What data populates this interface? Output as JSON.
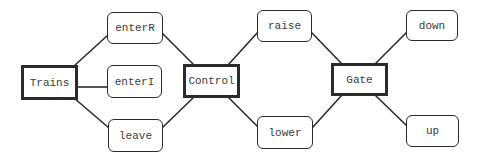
{
  "diagram": {
    "type": "process-action-graph",
    "nodes": [
      {
        "id": "trains",
        "label": "Trains",
        "kind": "process",
        "x": 21,
        "y": 65,
        "w": 57,
        "h": 35
      },
      {
        "id": "enterR",
        "label": "enterR",
        "kind": "action",
        "x": 107,
        "y": 12,
        "w": 56,
        "h": 32
      },
      {
        "id": "enterI",
        "label": "enterI",
        "kind": "action",
        "x": 107,
        "y": 65,
        "w": 55,
        "h": 33
      },
      {
        "id": "leave",
        "label": "leave",
        "kind": "action",
        "x": 108,
        "y": 119,
        "w": 55,
        "h": 33
      },
      {
        "id": "control",
        "label": "Control",
        "kind": "process",
        "x": 183,
        "y": 64,
        "w": 57,
        "h": 34
      },
      {
        "id": "raise",
        "label": "raise",
        "kind": "action",
        "x": 257,
        "y": 10,
        "w": 55,
        "h": 32
      },
      {
        "id": "lower",
        "label": "lower",
        "kind": "action",
        "x": 257,
        "y": 116,
        "w": 56,
        "h": 33
      },
      {
        "id": "gate",
        "label": "Gate",
        "kind": "process",
        "x": 331,
        "y": 63,
        "w": 57,
        "h": 33
      },
      {
        "id": "down",
        "label": "down",
        "kind": "action",
        "x": 406,
        "y": 10,
        "w": 52,
        "h": 31
      },
      {
        "id": "up",
        "label": "up",
        "kind": "action",
        "x": 406,
        "y": 115,
        "w": 53,
        "h": 32
      }
    ],
    "edges": [
      {
        "from": "trains",
        "to": "enterR",
        "x1": 74,
        "y1": 66,
        "x2": 108,
        "y2": 35
      },
      {
        "from": "trains",
        "to": "enterI",
        "x1": 77,
        "y1": 87,
        "x2": 107,
        "y2": 87
      },
      {
        "from": "trains",
        "to": "leave",
        "x1": 74,
        "y1": 98,
        "x2": 109,
        "y2": 128
      },
      {
        "from": "enterR",
        "to": "control",
        "x1": 162,
        "y1": 33,
        "x2": 194,
        "y2": 65
      },
      {
        "from": "leave",
        "to": "control",
        "x1": 162,
        "y1": 128,
        "x2": 194,
        "y2": 97
      },
      {
        "from": "control",
        "to": "raise",
        "x1": 228,
        "y1": 65,
        "x2": 258,
        "y2": 32
      },
      {
        "from": "control",
        "to": "lower",
        "x1": 228,
        "y1": 97,
        "x2": 258,
        "y2": 127
      },
      {
        "from": "raise",
        "to": "gate",
        "x1": 311,
        "y1": 32,
        "x2": 342,
        "y2": 64
      },
      {
        "from": "lower",
        "to": "gate",
        "x1": 312,
        "y1": 128,
        "x2": 342,
        "y2": 95
      },
      {
        "from": "gate",
        "to": "down",
        "x1": 375,
        "y1": 64,
        "x2": 407,
        "y2": 32
      },
      {
        "from": "gate",
        "to": "up",
        "x1": 375,
        "y1": 95,
        "x2": 407,
        "y2": 126
      }
    ],
    "colors": {
      "stroke": "#2b2b2b",
      "text": "#3a3a3a",
      "background": "#ffffff"
    }
  }
}
